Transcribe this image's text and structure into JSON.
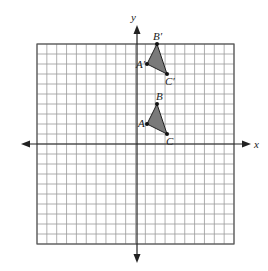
{
  "figure": {
    "type": "coordinate-plane",
    "axes": {
      "x_label": "x",
      "y_label": "y",
      "x_range": [
        -10,
        10
      ],
      "y_range": [
        -10,
        10
      ],
      "grid_step": 1,
      "grid": true,
      "tick_labels": false
    },
    "colors": {
      "grid_line": "#9a9a9a",
      "border": "#555555",
      "axis": "#222222",
      "triangle_fill": "#7a7a7a",
      "triangle_stroke": "#222222",
      "vertex_dot": "#111111"
    },
    "shapes": [
      {
        "name": "triangle-ABC",
        "vertices": [
          {
            "label": "A",
            "x": 1,
            "y": 2
          },
          {
            "label": "B",
            "x": 2,
            "y": 4
          },
          {
            "label": "C",
            "x": 3,
            "y": 1
          }
        ]
      },
      {
        "name": "triangle-A-prime-B-prime-C-prime",
        "vertices": [
          {
            "label": "A′",
            "x": 1,
            "y": 8
          },
          {
            "label": "B′",
            "x": 2,
            "y": 10
          },
          {
            "label": "C′",
            "x": 3,
            "y": 7
          }
        ]
      }
    ]
  },
  "labels": {
    "x_axis": "x",
    "y_axis": "y",
    "A": "A",
    "B": "B",
    "C": "C",
    "A_prime": "A′",
    "B_prime": "B′",
    "C_prime": "C′"
  }
}
